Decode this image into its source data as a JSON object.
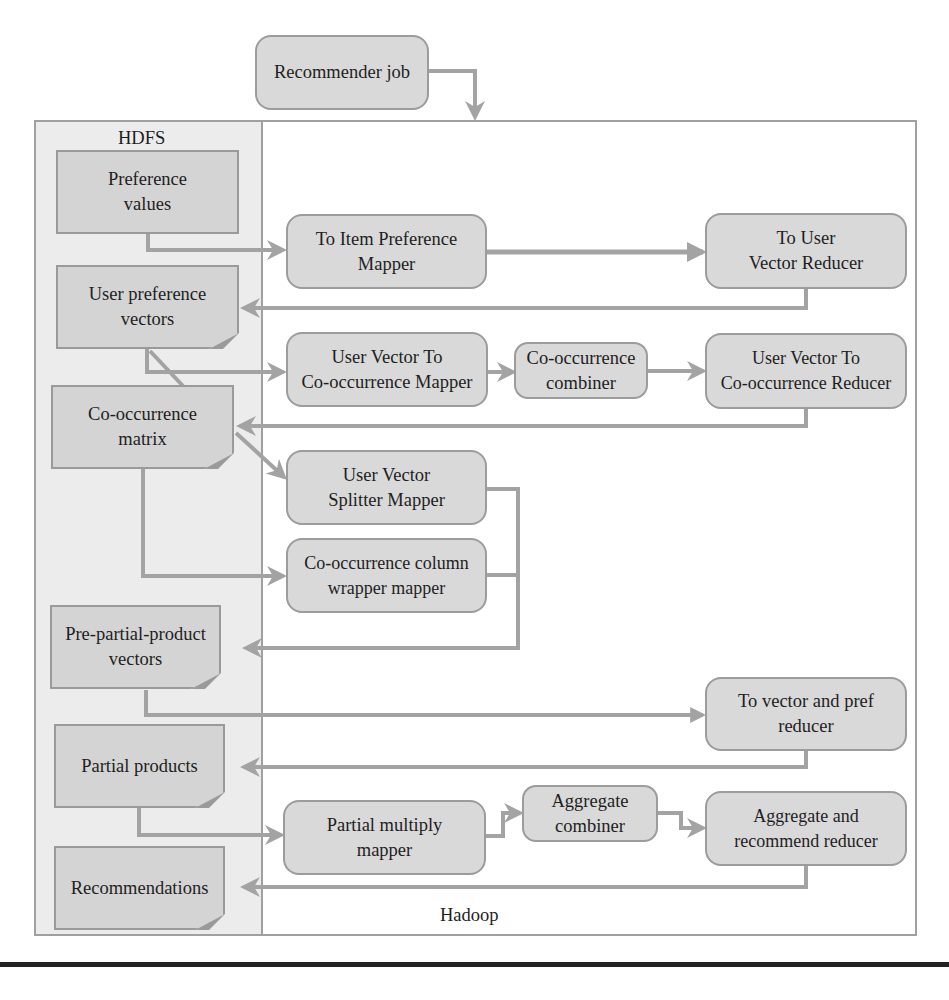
{
  "diagram": {
    "title_job": "Recommender job",
    "hdfs_label": "HDFS",
    "hadoop_label": "Hadoop",
    "colors": {
      "node_fill": "#d9d9d9",
      "doc_fill": "#d4d4d4",
      "border": "#9c9c9c",
      "arrow": "#a3a3a3",
      "hdfs_panel": "#ececec",
      "text": "#1e1e1e"
    },
    "hdfs_files": [
      {
        "id": "preference_values",
        "label": "Preference\nvalues"
      },
      {
        "id": "user_preference_vectors",
        "label": "User preference\nvectors"
      },
      {
        "id": "cooccurrence_matrix",
        "label": "Co-occurrence\nmatrix"
      },
      {
        "id": "pre_partial_product_vectors",
        "label": "Pre-partial-product\nvectors"
      },
      {
        "id": "partial_products",
        "label": "Partial products"
      },
      {
        "id": "recommendations",
        "label": "Recommendations"
      }
    ],
    "jobs": [
      {
        "id": "to_item_pref_mapper",
        "label": "To Item Preference\nMapper"
      },
      {
        "id": "to_user_vector_reducer",
        "label": "To User\nVector Reducer"
      },
      {
        "id": "uv_to_cooc_mapper",
        "label": "User Vector To\nCo-occurrence Mapper"
      },
      {
        "id": "cooc_combiner",
        "label": "Co-occurrence\ncombiner"
      },
      {
        "id": "uv_to_cooc_reducer",
        "label": "User Vector To\nCo-occurrence Reducer"
      },
      {
        "id": "uv_splitter_mapper",
        "label": "User Vector\nSplitter Mapper"
      },
      {
        "id": "cooc_column_wrapper_mapper",
        "label": "Co-occurrence column\nwrapper mapper"
      },
      {
        "id": "to_vector_pref_reducer",
        "label": "To vector and pref\nreducer"
      },
      {
        "id": "partial_multiply_mapper",
        "label": "Partial multiply\nmapper"
      },
      {
        "id": "aggregate_combiner",
        "label": "Aggregate\ncombiner"
      },
      {
        "id": "aggregate_recommend_reducer",
        "label": "Aggregate and\nrecommend reducer"
      }
    ],
    "edges": [
      [
        "Recommender job",
        "Hadoop"
      ],
      [
        "Preference values",
        "To Item Preference Mapper"
      ],
      [
        "To Item Preference Mapper",
        "To User Vector Reducer"
      ],
      [
        "To User Vector Reducer",
        "User preference vectors"
      ],
      [
        "User preference vectors",
        "User Vector To Co-occurrence Mapper"
      ],
      [
        "User Vector To Co-occurrence Mapper",
        "Co-occurrence combiner"
      ],
      [
        "Co-occurrence combiner",
        "User Vector To Co-occurrence Reducer"
      ],
      [
        "User Vector To Co-occurrence Reducer",
        "Co-occurrence matrix"
      ],
      [
        "User preference vectors",
        "User Vector Splitter Mapper"
      ],
      [
        "Co-occurrence matrix",
        "Co-occurrence column wrapper mapper"
      ],
      [
        "User Vector Splitter Mapper",
        "Pre-partial-product vectors"
      ],
      [
        "Co-occurrence column wrapper mapper",
        "Pre-partial-product vectors"
      ],
      [
        "Pre-partial-product vectors",
        "To vector and pref reducer"
      ],
      [
        "To vector and pref reducer",
        "Partial products"
      ],
      [
        "Partial products",
        "Partial multiply mapper"
      ],
      [
        "Partial multiply mapper",
        "Aggregate combiner"
      ],
      [
        "Aggregate combiner",
        "Aggregate and recommend reducer"
      ],
      [
        "Aggregate and recommend reducer",
        "Recommendations"
      ]
    ]
  }
}
